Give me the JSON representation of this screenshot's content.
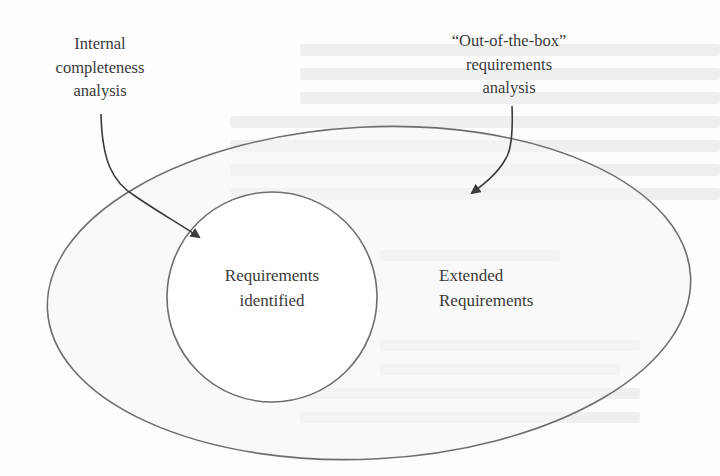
{
  "diagram": {
    "title": "",
    "colors": {
      "background": "#fdfdfd",
      "outer_fill": "#f6f6f6",
      "inner_fill": "#ffffff",
      "stroke": "#6e6e6e",
      "arrow": "#3c3c3c",
      "text": "#3a3a3a",
      "bleed_through": "#ececec"
    },
    "nodes": {
      "outer_region": {
        "shape": "ellipse",
        "label_lines": [
          "Extended",
          "Requirements"
        ]
      },
      "inner_region": {
        "shape": "circle",
        "label_lines": [
          "Requirements",
          "identified"
        ]
      }
    },
    "sources": {
      "internal": {
        "label_lines": [
          "Internal",
          "completeness",
          "analysis"
        ],
        "points_to": "inner_region"
      },
      "out_of_box": {
        "label_lines": [
          "“Out-of-the-box”",
          "requirements",
          "analysis"
        ],
        "points_to": "outer_region"
      }
    },
    "edges": [
      {
        "from": "Internal completeness analysis",
        "to": "Requirements identified",
        "icon": "arrow-icon"
      },
      {
        "from": "“Out-of-the-box” requirements analysis",
        "to": "Extended Requirements",
        "icon": "arrow-icon"
      }
    ]
  }
}
